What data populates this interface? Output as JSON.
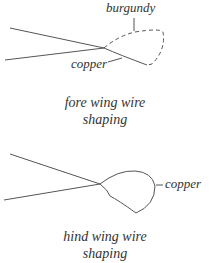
{
  "fore_wing": {
    "label_top": "burgundy",
    "label_bottom": "copper",
    "caption_line1": "fore wing wire",
    "caption_line2": "shaping"
  },
  "hind_wing": {
    "label_right": "copper",
    "caption_line1": "hind wing wire",
    "caption_line2": "shaping"
  },
  "colors": {
    "line": "#555555",
    "text": "#333333"
  }
}
